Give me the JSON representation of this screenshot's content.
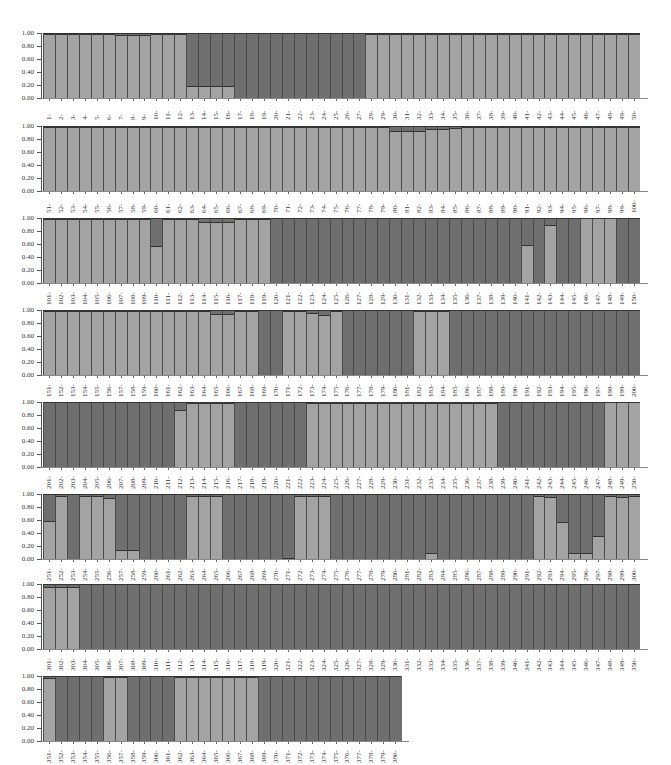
{
  "chart_data": {
    "type": "bar",
    "subtype": "stacked-structure-plot",
    "title": "",
    "xlabel": "",
    "ylabel": "",
    "ylim": [
      0,
      1
    ],
    "yticks": [
      "0.00",
      "0.20",
      "0.40",
      "0.60",
      "0.80",
      "1.00"
    ],
    "legend": [],
    "colors": {
      "cluster1": "#a3a3a3",
      "cluster2": "#6f6f6f"
    },
    "panels_per_row": 50,
    "n_individuals": 380,
    "series": [
      {
        "name": "Cluster 1 (light)",
        "note": "membership proportion, bottom segment"
      },
      {
        "name": "Cluster 2 (dark)",
        "note": "1 - cluster 1, top segment"
      }
    ],
    "categories_range": "1-380",
    "cluster1_values": [
      0.99,
      0.98,
      0.99,
      0.99,
      0.99,
      0.99,
      0.97,
      0.97,
      0.97,
      0.99,
      0.99,
      0.99,
      0.18,
      0.18,
      0.18,
      0.18,
      0,
      0,
      0,
      0,
      0,
      0,
      0,
      0,
      0,
      0,
      0,
      0.99,
      0.99,
      0.99,
      0.99,
      0.99,
      0.99,
      0.99,
      0.99,
      0.99,
      0.98,
      0.99,
      0.99,
      0.99,
      0.99,
      0.99,
      0.99,
      0.99,
      0.99,
      0.99,
      0.99,
      0.99,
      0.99,
      0.99,
      0.99,
      0.99,
      0.99,
      0.99,
      0.99,
      0.99,
      0.99,
      0.99,
      0.99,
      0.99,
      0.99,
      0.99,
      0.99,
      0.99,
      0.98,
      0.98,
      0.98,
      0.98,
      0.98,
      0.98,
      0.99,
      0.99,
      0.99,
      0.99,
      0.99,
      0.99,
      0.99,
      0.99,
      0.99,
      0.92,
      0.92,
      0.92,
      0.96,
      0.96,
      0.97,
      0.99,
      0.99,
      0.99,
      0.99,
      0.99,
      0.99,
      0.99,
      0.99,
      0.99,
      0.99,
      0.99,
      0.99,
      0.99,
      0.99,
      0.99,
      0.99,
      0.99,
      0.99,
      0.99,
      0.99,
      0.99,
      0.99,
      0.99,
      0.99,
      0.57,
      0.99,
      0.99,
      0.99,
      0.94,
      0.94,
      0.94,
      0.99,
      0.99,
      0.99,
      0,
      0,
      0,
      0,
      0,
      0,
      0,
      0,
      0,
      0,
      0,
      0,
      0,
      0,
      0,
      0,
      0,
      0,
      0,
      0,
      0,
      0.58,
      0,
      0.89,
      0,
      0,
      1,
      1,
      1,
      0,
      0,
      0.99,
      0.99,
      0.99,
      0.99,
      0.99,
      0.99,
      0.99,
      0.99,
      0.98,
      0.98,
      0.98,
      0.98,
      0.98,
      0.99,
      0.94,
      0.94,
      0.99,
      0.99,
      0,
      0,
      0.99,
      0.99,
      0.96,
      0.92,
      0.99,
      0,
      0,
      0,
      0,
      0,
      0,
      0.99,
      0.99,
      0.99,
      0,
      0,
      0,
      0,
      0,
      0,
      0,
      0,
      0,
      0,
      0,
      0,
      0,
      0,
      0,
      0,
      0,
      0,
      0,
      0,
      0,
      0,
      0,
      0,
      0,
      0,
      0,
      0.88,
      0.99,
      0.99,
      0.99,
      0.99,
      0,
      0,
      0,
      0,
      0,
      0,
      0.99,
      0.99,
      0.99,
      0.99,
      0.99,
      0.99,
      0.99,
      0.99,
      0.99,
      0.99,
      0.99,
      0.99,
      0.99,
      0.98,
      0.98,
      0.99,
      0,
      0,
      0,
      0,
      0,
      0,
      0,
      0,
      0,
      1,
      1,
      1,
      0.58,
      0.97,
      0,
      0.97,
      0.97,
      0.94,
      0.14,
      0.14,
      0,
      0,
      0,
      0,
      0.97,
      0.97,
      0.97,
      0,
      0,
      0,
      0,
      0,
      0.01,
      0.97,
      0.97,
      0.97,
      0,
      0,
      0,
      0,
      0,
      0,
      0,
      0,
      0.1,
      0,
      0,
      0,
      0,
      0,
      0,
      0,
      0,
      0.97,
      0.96,
      0.57,
      0.1,
      0.1,
      0.36,
      0.97,
      0.96,
      0.97,
      0.96,
      0.96,
      0.96,
      0,
      0,
      0,
      0,
      0,
      0,
      0,
      0,
      0,
      0,
      0,
      0,
      0,
      0,
      0,
      0,
      0,
      0,
      0,
      0,
      0,
      0,
      0,
      0,
      0,
      0,
      0,
      0,
      0,
      0,
      0,
      0,
      0,
      0,
      0,
      0,
      0,
      0,
      0,
      0,
      0,
      0,
      0,
      0,
      0,
      0,
      0,
      0.97,
      0,
      0,
      0,
      0,
      0.99,
      0.99,
      0,
      0,
      0,
      0,
      0.99,
      0.99,
      0.99,
      0.99,
      0.99,
      0.99,
      0.99,
      0,
      0,
      0,
      0,
      0,
      0,
      0,
      0,
      0,
      0,
      0,
      0
    ],
    "panels": [
      {
        "range": "1-50"
      },
      {
        "range": "51-100"
      },
      {
        "range": "101-150"
      },
      {
        "range": "151-200"
      },
      {
        "range": "201-250"
      },
      {
        "range": "251-300"
      },
      {
        "range": "301-350"
      },
      {
        "range": "351-380"
      }
    ]
  }
}
